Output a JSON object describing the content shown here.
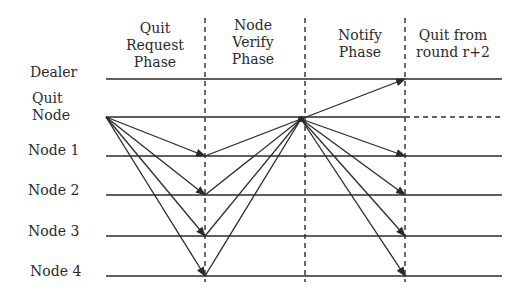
{
  "phases": [
    {
      "lines": [
        "Quit",
        "Request",
        "Phase"
      ]
    },
    {
      "lines": [
        "Node",
        "Verify",
        "Phase"
      ]
    },
    {
      "lines": [
        "Notify",
        "Phase"
      ]
    },
    {
      "lines": [
        "Quit from",
        "round r+2"
      ]
    }
  ],
  "rows": [
    {
      "label": "Dealer"
    },
    {
      "label_lines": [
        "Quit",
        "Node"
      ]
    },
    {
      "label": "Node 1"
    },
    {
      "label": "Node 2"
    },
    {
      "label": "Node 3"
    },
    {
      "label": "Node 4"
    }
  ],
  "colors": {
    "line": "#2a2a2a",
    "background": "#ffffff"
  }
}
